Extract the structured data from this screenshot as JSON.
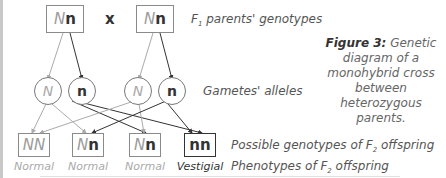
{
  "parents": {
    "left": {
      "dominant": "N",
      "recessive": "n"
    },
    "cross_symbol": "x",
    "right": {
      "dominant": "N",
      "recessive": "n"
    }
  },
  "gametes": [
    "N",
    "n",
    "N",
    "n"
  ],
  "offspring": [
    {
      "genotype_a": "N",
      "genotype_b": "N",
      "phenotype": "Normal"
    },
    {
      "genotype_a": "N",
      "genotype_b": "n",
      "phenotype": "Normal"
    },
    {
      "genotype_a": "N",
      "genotype_b": "n",
      "phenotype": "Normal"
    },
    {
      "genotype_a": "n",
      "genotype_b": "n",
      "phenotype": "Vestigial"
    }
  ],
  "labels": {
    "parents_prefix": "F",
    "parents_sub": "1",
    "parents_suffix": " parents' genotypes",
    "gametes": "Gametes' alleles",
    "genotypes_prefix": "Possible genotypes of F",
    "genotypes_sub": "2",
    "genotypes_suffix": " offspring",
    "phenotypes_prefix": "Phenotypes of F",
    "phenotypes_sub": "2",
    "phenotypes_suffix": " offspring"
  },
  "caption": {
    "bold": "Figure 3:",
    "text": " Genetic diagram of a monohybrid cross between heterozygous parents."
  },
  "colors": {
    "dark_line": "#333333",
    "light_line": "#aaaaaa",
    "border": "#8a8a8a"
  }
}
